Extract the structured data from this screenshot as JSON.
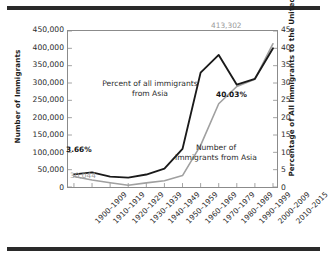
{
  "chart_data": {
    "type": "line",
    "title": "",
    "subtitle": "",
    "xlabel": "",
    "ylabel": "Number of Immigrants",
    "y2label": "Percentage of All Immigrants to the United States",
    "grid": false,
    "legend_position": "inline-annotations",
    "categories": [
      "1900–1909",
      "1910–1919",
      "1920–1929",
      "1930–1939",
      "1940–1949",
      "1950–1959",
      "1960–1969",
      "1970–1979",
      "1980–1989",
      "1990–1999",
      "2000–2009",
      "2010–2015"
    ],
    "ylim": [
      0,
      450000
    ],
    "yticks": [
      "0",
      "50,000",
      "100,000",
      "150,000",
      "200,000",
      "250,000",
      "300,000",
      "350,000",
      "400,000",
      "450,000"
    ],
    "y2lim": [
      0,
      45
    ],
    "y2ticks": [
      "0",
      "5",
      "10",
      "15",
      "20",
      "25",
      "30",
      "35",
      "40",
      "45"
    ],
    "series": [
      {
        "name": "Percent of all immigrants from Asia",
        "axis": "right",
        "color": "#1a1a1a",
        "unit": "percent",
        "values": [
          3.66,
          4.2,
          3.0,
          2.7,
          3.6,
          5.3,
          11.0,
          33.0,
          38.1,
          29.5,
          31.2,
          40.03
        ]
      },
      {
        "name": "Number of immigrants from Asia",
        "axis": "left",
        "color": "#a0a0a0",
        "unit": "immigrants",
        "values": [
          30044,
          20000,
          12000,
          5000,
          12000,
          18000,
          33000,
          120000,
          240000,
          290000,
          311000,
          413302
        ]
      }
    ],
    "annotations": [
      {
        "id": "first-percent",
        "text": "3.66%",
        "style": "bold",
        "color": "#141414"
      },
      {
        "id": "first-number",
        "text": "30,044",
        "style": "gray",
        "color": "#9a9a9a"
      },
      {
        "id": "last-number",
        "text": "413,302",
        "style": "gray",
        "color": "#9a9a9a"
      },
      {
        "id": "last-percent",
        "text": "40.03%",
        "style": "bold",
        "color": "#141414"
      },
      {
        "id": "percent-series-label",
        "text": "Percent of all immigrants\nfrom Asia",
        "style": "plain",
        "color": "#2b2b2b"
      },
      {
        "id": "number-series-label",
        "text": "Number of\nimmigrants from Asia",
        "style": "plain",
        "color": "#2b2b2b"
      }
    ]
  },
  "labels": {
    "y_axis_title": "Number of Immigrants",
    "y2_axis_title": "Percentage of All Immigrants to the United States",
    "percent_series_line1": "Percent of all immigrants",
    "percent_series_line2": "from Asia",
    "number_series_line1": "Number of",
    "number_series_line2": "immigrants from Asia",
    "tag_first_percent": "3.66%",
    "tag_first_number": "30,044",
    "tag_last_number": "413,302",
    "tag_last_percent": "40.03%"
  },
  "colors": {
    "percent_line": "#1a1a1a",
    "number_line": "#a0a0a0",
    "axis": "#8b8b8b",
    "text": "#2b2b2b",
    "rule": "#2a2a2a"
  }
}
